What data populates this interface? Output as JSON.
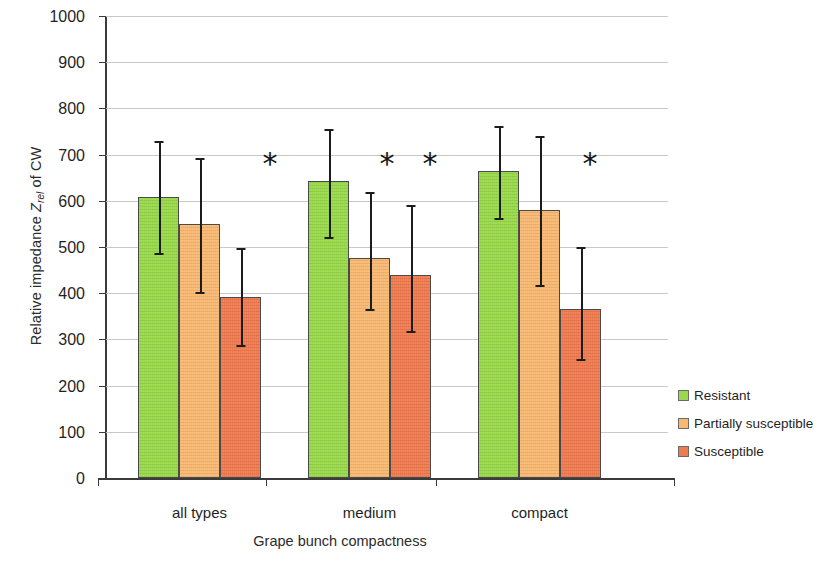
{
  "chart_data": {
    "type": "bar",
    "title": "",
    "xlabel": "Grape bunch compactness",
    "ylabel_prefix": "Relative impedance ",
    "ylabel_symbol": "Z",
    "ylabel_subscript": "rel",
    "ylabel_suffix": " of CW",
    "ylim": [
      0,
      1000
    ],
    "ytick_step": 100,
    "yticks": [
      "1000",
      "900",
      "800",
      "700",
      "600",
      "500",
      "400",
      "300",
      "200",
      "100",
      "0"
    ],
    "grid": true,
    "legend_position": "right",
    "categories": [
      "all types",
      "medium",
      "compact"
    ],
    "series": [
      {
        "name": "Resistant",
        "color": "#9ad84e",
        "values": [
          608,
          642,
          665
        ],
        "errors_upper": [
          730,
          755,
          762
        ],
        "errors_lower": [
          487,
          522,
          563
        ]
      },
      {
        "name": "Partially susceptible",
        "color": "#fbb96f",
        "values": [
          549,
          477,
          580
        ],
        "errors_upper": [
          692,
          620,
          740
        ],
        "errors_lower": [
          402,
          365,
          418
        ]
      },
      {
        "name": "Susceptible",
        "color": "#ee7c52",
        "values": [
          392,
          440,
          365
        ],
        "errors_upper": [
          497,
          590,
          500
        ],
        "errors_lower": [
          287,
          318,
          258
        ]
      }
    ],
    "annotations": [
      {
        "label": "*",
        "group": "all types",
        "value": 680
      },
      {
        "label": "*",
        "group": "medium",
        "value": 680
      },
      {
        "label": "*",
        "group": "medium",
        "value": 680
      },
      {
        "label": "*",
        "group": "compact",
        "value": 680
      }
    ]
  }
}
